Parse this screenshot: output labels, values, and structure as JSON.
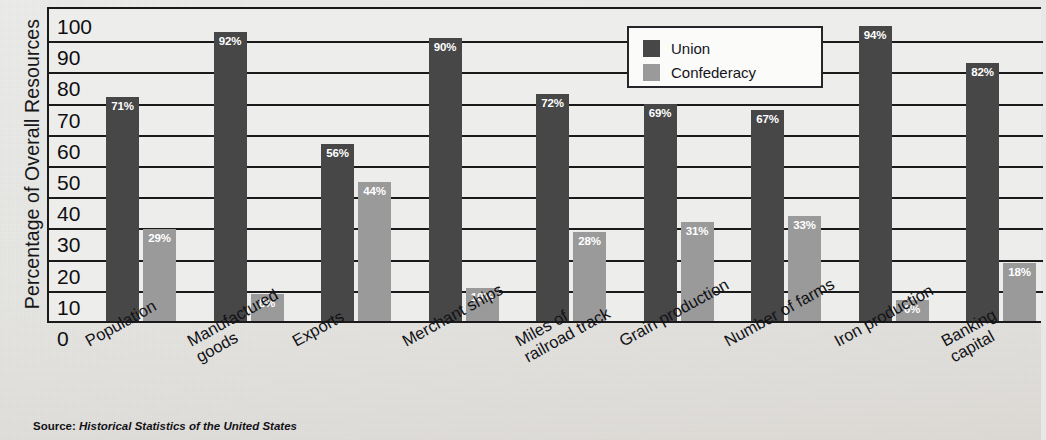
{
  "axis": {
    "y_title": "Percentage of Overall Resources",
    "y_ticks": [
      "100",
      "90",
      "80",
      "70",
      "60",
      "50",
      "40",
      "30",
      "20",
      "10",
      "0"
    ],
    "y_min": 0,
    "y_max": 100
  },
  "legend": {
    "union_label": "Union",
    "confederacy_label": "Confederacy"
  },
  "source": {
    "prefix": "Source:",
    "text": "Historical Statistics of the United States"
  },
  "colors": {
    "union": "#474747",
    "confederacy": "#9a9a9a",
    "plot_background": "#ededeb",
    "page_background": "#e8e8e6",
    "axis": "#1a1a1a",
    "value_label": "#ffffff"
  },
  "categories": [
    {
      "label": "Population",
      "union": 71,
      "confederacy": 29,
      "union_text": "71%",
      "confederacy_text": "29%"
    },
    {
      "label": "Manufactured\ngoods",
      "union": 92,
      "confederacy": 8,
      "union_text": "92%",
      "confederacy_text": "8%"
    },
    {
      "label": "Exports",
      "union": 56,
      "confederacy": 44,
      "union_text": "56%",
      "confederacy_text": "44%"
    },
    {
      "label": "Merchant ships",
      "union": 90,
      "confederacy": 10,
      "union_text": "90%",
      "confederacy_text": "10%"
    },
    {
      "label": "Miles of\nrailroad track",
      "union": 72,
      "confederacy": 28,
      "union_text": "72%",
      "confederacy_text": "28%"
    },
    {
      "label": "Grain production",
      "union": 69,
      "confederacy": 31,
      "union_text": "69%",
      "confederacy_text": "31%"
    },
    {
      "label": "Number of farms",
      "union": 67,
      "confederacy": 33,
      "union_text": "67%",
      "confederacy_text": "33%"
    },
    {
      "label": "Iron production",
      "union": 94,
      "confederacy": 6,
      "union_text": "94%",
      "confederacy_text": "6%"
    },
    {
      "label": "Banking capital",
      "union": 82,
      "confederacy": 18,
      "union_text": "82%",
      "confederacy_text": "18%"
    }
  ],
  "chart_data": {
    "type": "bar",
    "title": "",
    "xlabel": "",
    "ylabel": "Percentage of Overall Resources",
    "ylim": [
      0,
      100
    ],
    "ytick_step": 10,
    "grid": true,
    "legend_position": "top-center",
    "value_label_suffix": "%",
    "categories": [
      "Population",
      "Manufactured goods",
      "Exports",
      "Merchant ships",
      "Miles of railroad track",
      "Grain production",
      "Number of farms",
      "Iron production",
      "Banking capital"
    ],
    "series": [
      {
        "name": "Union",
        "color": "#474747",
        "values": [
          71,
          92,
          56,
          90,
          72,
          69,
          67,
          94,
          82
        ]
      },
      {
        "name": "Confederacy",
        "color": "#9a9a9a",
        "values": [
          29,
          8,
          44,
          10,
          28,
          31,
          33,
          6,
          18
        ]
      }
    ],
    "source": "Historical Statistics of the United States"
  }
}
